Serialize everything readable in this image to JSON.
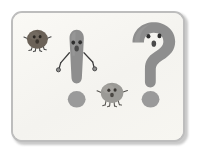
{
  "illustration": {
    "title": "Punctuation characters illustration",
    "description": "Cartoon exclamation mark and question mark with faces and limbs, accompanied by two small round creatures on a framed off-white card",
    "frame": {
      "border_color": "#bdbdbd",
      "background_color": "#f7f6f2",
      "corner_radius": "11px",
      "shadow_color": "#c9c9c9"
    },
    "palette": {
      "body_gray": "#8e8e8e",
      "body_gray_light": "#9a9a9a",
      "dark_creature": "#6b6258",
      "light_creature": "#9b9a96",
      "outline_dark": "#3a3a3a",
      "eye_color": "#2f2f2f",
      "limb_color": "#4a4a4a",
      "paper": "#f7f6f2"
    },
    "characters": [
      {
        "id": "dark-bug",
        "name": "small-dark-creature",
        "label": "Small dark round creature",
        "body_color": "#6b6258",
        "position": "left",
        "features": [
          "two eyes",
          "small mouth",
          "four legs",
          "two arms"
        ]
      },
      {
        "id": "exclamation",
        "name": "exclamation-mark-character",
        "label": "Exclamation mark character",
        "glyph": "!",
        "body_color": "#8e8e8e",
        "position": "center-left",
        "features": [
          "two eyes",
          "open mouth",
          "two thin arms with hands",
          "separate dot base"
        ]
      },
      {
        "id": "light-bug",
        "name": "small-light-creature",
        "label": "Small light round creature",
        "body_color": "#9b9a96",
        "position": "center-right",
        "features": [
          "two eyes",
          "small mouth",
          "four legs",
          "two arms"
        ]
      },
      {
        "id": "question",
        "name": "question-mark-character",
        "label": "Question mark character",
        "glyph": "?",
        "body_color": "#8e8e8e",
        "position": "right",
        "features": [
          "two eyes",
          "oval mouth",
          "separate dot base"
        ]
      }
    ]
  }
}
